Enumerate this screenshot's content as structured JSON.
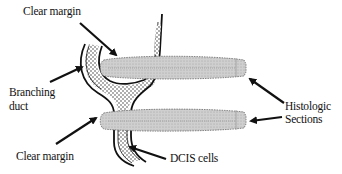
{
  "diagram": {
    "type": "anatomical-schematic",
    "labels": {
      "clear_margin_top": "Clear margin",
      "branching_duct_line1": "Branching",
      "branching_duct_line2": "duct",
      "clear_margin_bottom": "Clear margin",
      "dcis_cells": "DCIS cells",
      "histologic_line1": "Histologic",
      "histologic_line2": "Sections"
    },
    "colors": {
      "ink": "#111111",
      "section_fill": "#c8c8c8",
      "section_edge": "#6a6a6a",
      "background": "#ffffff"
    }
  }
}
